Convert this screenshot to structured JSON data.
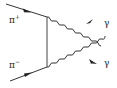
{
  "diagram": {
    "type": "feynman",
    "particles": {
      "pi_plus": {
        "label": "π",
        "charge": "+"
      },
      "pi_minus": {
        "label": "π",
        "charge": "−"
      },
      "gamma_top": {
        "label": "γ"
      },
      "gamma_bottom": {
        "label": "γ"
      }
    },
    "colors": {
      "line": "#333333",
      "background": "#ffffff"
    }
  }
}
